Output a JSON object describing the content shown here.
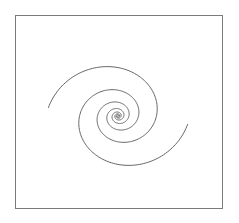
{
  "figure": {
    "frame": {
      "x": 15,
      "y": 15,
      "width": 207,
      "height": 193,
      "stroke": "#7a7a7a"
    },
    "spiral": {
      "center": [
        118,
        116
      ],
      "arms": 2,
      "stroke": "#555555",
      "stroke_width": 0.9,
      "a": 1.6,
      "b": 0.2,
      "theta_start": 0.0,
      "theta_end": 21.9,
      "rotation_deg": 182,
      "y_scale": 0.92
    }
  }
}
